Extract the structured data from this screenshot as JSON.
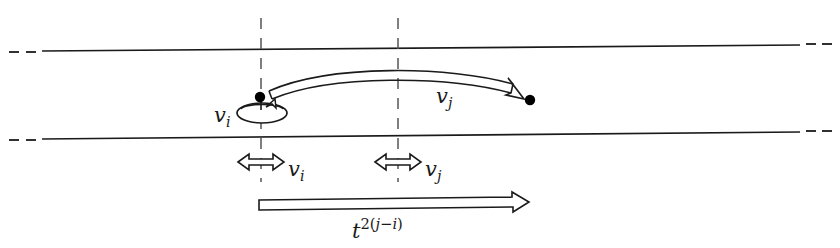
{
  "figure": {
    "type": "diagram",
    "background_color": "#ffffff",
    "line_color": "#1a1a1a",
    "width": 840,
    "height": 248
  },
  "labels": {
    "self_loop": {
      "base": "v",
      "sub": "i"
    },
    "arc_arrow": {
      "base": "v",
      "sub": "j"
    },
    "measure_left": {
      "base": "v",
      "sub": "i"
    },
    "measure_right": {
      "base": "v",
      "sub": "j"
    },
    "span_arrow": {
      "base": "t",
      "sup_pre": "2(",
      "sup_j": "j",
      "sup_minus": "−",
      "sup_i": "i",
      "sup_post": ")"
    }
  },
  "elements": {
    "band_top_line": {
      "name": "upper-band-line",
      "y_left": 50,
      "y_right": 46
    },
    "band_bottom_line": {
      "name": "lower-band-line",
      "y_left": 138,
      "y_right": 133
    },
    "dashed_guide_left": {
      "name": "dashed-guide-left",
      "x": 261
    },
    "dashed_guide_right": {
      "name": "dashed-guide-right",
      "x": 398
    },
    "vertex_left": {
      "name": "vertex-vi",
      "cx": 260,
      "cy": 97
    },
    "vertex_right": {
      "name": "vertex-vj",
      "cx": 530,
      "cy": 100
    },
    "self_loop_ellipse": {
      "name": "self-loop",
      "cx": 262,
      "cy": 112,
      "rx": 24,
      "ry": 10
    },
    "curved_ribbon_arrow": {
      "name": "arc-arrow-vj",
      "from_x": 268,
      "from_y": 96,
      "to_x": 524,
      "to_y": 99
    },
    "double_arrow_left": {
      "name": "measure-arrow-vi",
      "x1": 238,
      "x2": 284,
      "y": 162
    },
    "double_arrow_right": {
      "name": "measure-arrow-vj",
      "x1": 375,
      "x2": 421,
      "y": 162
    },
    "span_arrow_bottom": {
      "name": "span-arrow-t",
      "x1": 259,
      "x2": 528,
      "y": 203
    }
  },
  "dash_ticks": {
    "top_left": [
      [
        12,
        51
      ],
      [
        32,
        51
      ]
    ],
    "top_right": [
      [
        806,
        45
      ],
      [
        826,
        45
      ]
    ],
    "bottom_left": [
      [
        12,
        139
      ],
      [
        32,
        139
      ]
    ],
    "bottom_right": [
      [
        806,
        132
      ],
      [
        826,
        132
      ]
    ]
  }
}
